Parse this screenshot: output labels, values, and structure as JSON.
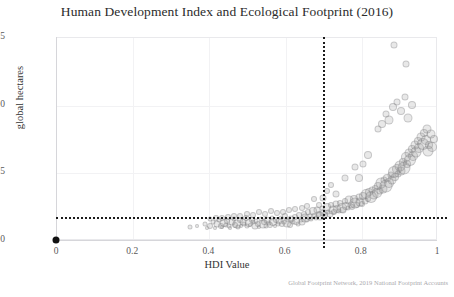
{
  "chart_data": {
    "type": "scatter",
    "title": "Human Development Index and Ecological Footprint (2016)",
    "xlabel": "HDI Value",
    "ylabel": "global hectares",
    "xlim": [
      0,
      1
    ],
    "ylim": [
      0,
      15
    ],
    "xticks": [
      "0",
      "0.2",
      "0.4",
      "0.6",
      "0.8",
      "1"
    ],
    "xtick_values": [
      0,
      0.2,
      0.4,
      0.6,
      0.8,
      1
    ],
    "yticks": [
      "0",
      "5",
      "10",
      "15"
    ],
    "ytick_values": [
      0,
      5,
      10,
      15
    ],
    "grid": true,
    "legend": null,
    "source_note": "Global Footprint Network, 2019 National Footprint Accounts",
    "marker_style": {
      "shape": "circle",
      "fill": "#969698",
      "fill_opacity": 0.22,
      "edge": "#78787c",
      "sized_by_value": true
    },
    "reference_lines": [
      {
        "name": "hdi-threshold",
        "orientation": "vertical",
        "value": 0.7,
        "style": "dotted",
        "color": "#1b1b1b"
      },
      {
        "name": "biocapacity-threshold",
        "orientation": "horizontal",
        "value": 1.7,
        "style": "dotted",
        "color": "#1b1b1b"
      }
    ],
    "origin_marker": {
      "x": 0,
      "y": 0,
      "color": "#111111",
      "size": 7
    },
    "points": [
      [
        0.352,
        0.95,
        5
      ],
      [
        0.37,
        1.05,
        4
      ],
      [
        0.392,
        1.2,
        5
      ],
      [
        0.396,
        0.9,
        4
      ],
      [
        0.404,
        1.0,
        6
      ],
      [
        0.412,
        1.35,
        5
      ],
      [
        0.418,
        0.85,
        4
      ],
      [
        0.423,
        1.15,
        7
      ],
      [
        0.428,
        1.5,
        5
      ],
      [
        0.433,
        1.05,
        6
      ],
      [
        0.437,
        0.95,
        4
      ],
      [
        0.441,
        1.25,
        8
      ],
      [
        0.446,
        1.1,
        5
      ],
      [
        0.45,
        1.4,
        6
      ],
      [
        0.454,
        1.0,
        5
      ],
      [
        0.458,
        0.9,
        4
      ],
      [
        0.462,
        1.3,
        7
      ],
      [
        0.466,
        1.55,
        5
      ],
      [
        0.47,
        1.1,
        6
      ],
      [
        0.474,
        1.2,
        9
      ],
      [
        0.478,
        0.95,
        5
      ],
      [
        0.482,
        1.45,
        6
      ],
      [
        0.486,
        1.05,
        4
      ],
      [
        0.49,
        1.35,
        7
      ],
      [
        0.494,
        1.15,
        5
      ],
      [
        0.498,
        1.6,
        6
      ],
      [
        0.502,
        1.0,
        5
      ],
      [
        0.506,
        1.25,
        8
      ],
      [
        0.51,
        1.1,
        4
      ],
      [
        0.514,
        1.5,
        6
      ],
      [
        0.518,
        1.3,
        5
      ],
      [
        0.522,
        1.05,
        7
      ],
      [
        0.526,
        1.4,
        5
      ],
      [
        0.53,
        1.2,
        6
      ],
      [
        0.534,
        0.95,
        4
      ],
      [
        0.538,
        1.55,
        5
      ],
      [
        0.542,
        1.15,
        9
      ],
      [
        0.546,
        1.35,
        6
      ],
      [
        0.55,
        1.0,
        5
      ],
      [
        0.554,
        1.45,
        7
      ],
      [
        0.558,
        1.25,
        5
      ],
      [
        0.562,
        1.1,
        6
      ],
      [
        0.566,
        1.65,
        5
      ],
      [
        0.57,
        1.3,
        8
      ],
      [
        0.574,
        1.05,
        4
      ],
      [
        0.578,
        1.5,
        6
      ],
      [
        0.582,
        1.2,
        5
      ],
      [
        0.586,
        1.4,
        7
      ],
      [
        0.59,
        1.6,
        5
      ],
      [
        0.594,
        1.15,
        6
      ],
      [
        0.598,
        1.35,
        5
      ],
      [
        0.602,
        1.75,
        6
      ],
      [
        0.606,
        1.25,
        9
      ],
      [
        0.61,
        1.45,
        5
      ],
      [
        0.614,
        1.1,
        6
      ],
      [
        0.618,
        1.55,
        7
      ],
      [
        0.622,
        1.3,
        5
      ],
      [
        0.626,
        1.7,
        6
      ],
      [
        0.63,
        1.4,
        8
      ],
      [
        0.634,
        1.2,
        5
      ],
      [
        0.638,
        1.85,
        6
      ],
      [
        0.642,
        1.5,
        5
      ],
      [
        0.646,
        1.35,
        7
      ],
      [
        0.65,
        1.95,
        6
      ],
      [
        0.654,
        1.6,
        9
      ],
      [
        0.658,
        1.45,
        5
      ],
      [
        0.662,
        2.05,
        6
      ],
      [
        0.666,
        1.7,
        7
      ],
      [
        0.67,
        1.55,
        5
      ],
      [
        0.674,
        2.15,
        8
      ],
      [
        0.678,
        1.8,
        6
      ],
      [
        0.682,
        1.65,
        5
      ],
      [
        0.686,
        2.25,
        7
      ],
      [
        0.69,
        1.9,
        6
      ],
      [
        0.694,
        1.75,
        9
      ],
      [
        0.698,
        2.35,
        5
      ],
      [
        0.702,
        2.0,
        7
      ],
      [
        0.706,
        1.85,
        6
      ],
      [
        0.71,
        2.45,
        8
      ],
      [
        0.714,
        2.1,
        5
      ],
      [
        0.718,
        1.95,
        7
      ],
      [
        0.722,
        2.55,
        6
      ],
      [
        0.726,
        2.2,
        9
      ],
      [
        0.73,
        2.05,
        6
      ],
      [
        0.734,
        2.65,
        7
      ],
      [
        0.738,
        2.3,
        8
      ],
      [
        0.742,
        2.15,
        5
      ],
      [
        0.746,
        2.75,
        6
      ],
      [
        0.75,
        2.4,
        10
      ],
      [
        0.754,
        2.25,
        7
      ],
      [
        0.758,
        2.85,
        6
      ],
      [
        0.762,
        2.5,
        8
      ],
      [
        0.766,
        2.35,
        5
      ],
      [
        0.77,
        2.95,
        9
      ],
      [
        0.774,
        2.6,
        7
      ],
      [
        0.778,
        2.45,
        6
      ],
      [
        0.782,
        3.05,
        8
      ],
      [
        0.786,
        2.7,
        11
      ],
      [
        0.79,
        2.55,
        6
      ],
      [
        0.794,
        3.15,
        7
      ],
      [
        0.798,
        2.8,
        9
      ],
      [
        0.802,
        2.65,
        6
      ],
      [
        0.806,
        3.25,
        8
      ],
      [
        0.81,
        2.9,
        7
      ],
      [
        0.814,
        3.4,
        10
      ],
      [
        0.818,
        3.0,
        6
      ],
      [
        0.822,
        3.55,
        8
      ],
      [
        0.826,
        3.15,
        12
      ],
      [
        0.83,
        3.7,
        7
      ],
      [
        0.834,
        3.3,
        9
      ],
      [
        0.838,
        3.85,
        6
      ],
      [
        0.842,
        3.45,
        10
      ],
      [
        0.846,
        4.0,
        8
      ],
      [
        0.85,
        3.6,
        7
      ],
      [
        0.854,
        4.2,
        11
      ],
      [
        0.858,
        3.8,
        9
      ],
      [
        0.862,
        4.4,
        7
      ],
      [
        0.866,
        4.0,
        13
      ],
      [
        0.87,
        4.6,
        8
      ],
      [
        0.874,
        4.2,
        10
      ],
      [
        0.878,
        4.8,
        7
      ],
      [
        0.882,
        4.45,
        9
      ],
      [
        0.886,
        5.0,
        12
      ],
      [
        0.89,
        4.65,
        8
      ],
      [
        0.894,
        5.25,
        10
      ],
      [
        0.898,
        4.9,
        7
      ],
      [
        0.902,
        5.5,
        11
      ],
      [
        0.906,
        5.1,
        9
      ],
      [
        0.91,
        5.8,
        8
      ],
      [
        0.914,
        5.35,
        13
      ],
      [
        0.918,
        6.1,
        10
      ],
      [
        0.922,
        5.6,
        8
      ],
      [
        0.926,
        6.4,
        9
      ],
      [
        0.93,
        5.9,
        12
      ],
      [
        0.934,
        6.7,
        8
      ],
      [
        0.938,
        6.2,
        10
      ],
      [
        0.942,
        7.0,
        9
      ],
      [
        0.946,
        6.5,
        11
      ],
      [
        0.95,
        7.3,
        8
      ],
      [
        0.954,
        6.8,
        10
      ],
      [
        0.958,
        7.6,
        9
      ],
      [
        0.962,
        7.1,
        12
      ],
      [
        0.966,
        7.9,
        8
      ],
      [
        0.97,
        7.4,
        10
      ],
      [
        0.974,
        8.2,
        9
      ],
      [
        0.976,
        6.6,
        11
      ],
      [
        0.98,
        7.0,
        8
      ],
      [
        0.984,
        7.8,
        9
      ],
      [
        0.988,
        6.9,
        10
      ],
      [
        0.992,
        7.5,
        8
      ],
      [
        0.845,
        8.2,
        7
      ],
      [
        0.855,
        8.6,
        8
      ],
      [
        0.865,
        9.3,
        7
      ],
      [
        0.875,
        8.9,
        9
      ],
      [
        0.885,
        9.8,
        8
      ],
      [
        0.895,
        10.2,
        7
      ],
      [
        0.905,
        9.5,
        8
      ],
      [
        0.915,
        10.6,
        7
      ],
      [
        0.925,
        9.0,
        9
      ],
      [
        0.935,
        10.0,
        8
      ],
      [
        0.888,
        14.4,
        7
      ],
      [
        0.918,
        13.0,
        7
      ],
      [
        0.82,
        6.3,
        8
      ],
      [
        0.806,
        5.6,
        7
      ],
      [
        0.796,
        4.6,
        8
      ],
      [
        0.786,
        5.4,
        7
      ],
      [
        0.758,
        4.6,
        7
      ],
      [
        0.736,
        3.4,
        7
      ],
      [
        0.722,
        4.1,
        6
      ],
      [
        0.712,
        3.6,
        6
      ],
      [
        0.7,
        3.1,
        7
      ],
      [
        0.69,
        2.6,
        6
      ],
      [
        0.676,
        3.0,
        6
      ],
      [
        0.66,
        2.5,
        6
      ],
      [
        0.646,
        2.4,
        6
      ],
      [
        0.628,
        2.3,
        6
      ],
      [
        0.612,
        2.2,
        6
      ],
      [
        0.596,
        2.1,
        6
      ],
      [
        0.58,
        2.0,
        6
      ],
      [
        0.564,
        2.15,
        6
      ],
      [
        0.548,
        1.95,
        6
      ],
      [
        0.532,
        2.05,
        6
      ],
      [
        0.516,
        1.85,
        6
      ],
      [
        0.5,
        1.9,
        6
      ],
      [
        0.484,
        1.8,
        6
      ],
      [
        0.468,
        1.75,
        6
      ],
      [
        0.452,
        1.7,
        6
      ],
      [
        0.436,
        1.65,
        6
      ],
      [
        0.42,
        1.6,
        6
      ],
      [
        0.404,
        1.55,
        5
      ]
    ]
  }
}
